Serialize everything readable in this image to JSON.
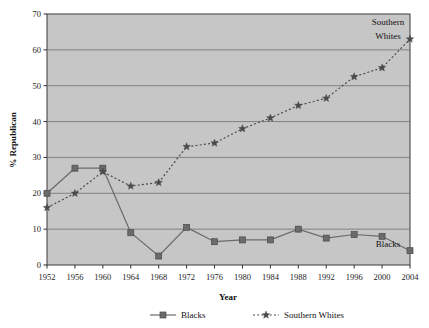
{
  "chart_data": {
    "type": "line",
    "title": "",
    "xlabel": "Year",
    "ylabel": "% Republican",
    "xlim": [
      1952,
      2004
    ],
    "ylim": [
      0,
      70
    ],
    "ytick_step": 10,
    "grid": "horizontal",
    "plot_background": "#c6c6c6",
    "legend_position": "bottom",
    "categories": [
      1952,
      1956,
      1960,
      1964,
      1968,
      1972,
      1976,
      1980,
      1984,
      1988,
      1992,
      1996,
      2000,
      2004
    ],
    "xticks": [
      "1952",
      "1956",
      "1960",
      "1964",
      "1968",
      "1972",
      "1976",
      "1980",
      "1984",
      "1988",
      "1992",
      "1996",
      "2000",
      "2004"
    ],
    "yticks": [
      "0",
      "10",
      "20",
      "30",
      "40",
      "50",
      "60",
      "70"
    ],
    "series": [
      {
        "name": "Blacks",
        "marker": "square",
        "linestyle": "solid",
        "color": "#6b6b6b",
        "values": [
          20,
          27,
          27,
          9,
          2.5,
          10.5,
          6.5,
          7,
          7,
          10,
          7.5,
          8.5,
          8,
          4
        ]
      },
      {
        "name": "Southern Whites",
        "marker": "star",
        "linestyle": "dotted",
        "color": "#4a4a4a",
        "values": [
          16,
          20,
          26,
          22,
          23,
          33,
          34,
          38,
          41,
          44.5,
          46.5,
          52.5,
          55,
          63
        ]
      }
    ],
    "annotations": [
      {
        "text": "Southern",
        "x": 2000,
        "y": 67,
        "series": "Southern Whites"
      },
      {
        "text": "Whites",
        "x": 2000,
        "y": 63,
        "series": "Southern Whites"
      },
      {
        "text": "Blacks",
        "x": 2000,
        "y": 5,
        "series": "Blacks"
      }
    ]
  },
  "legend": {
    "items": [
      {
        "label": "Blacks",
        "marker": "square",
        "linestyle": "solid"
      },
      {
        "label": "Southern Whites",
        "marker": "star",
        "linestyle": "dotted"
      }
    ]
  }
}
